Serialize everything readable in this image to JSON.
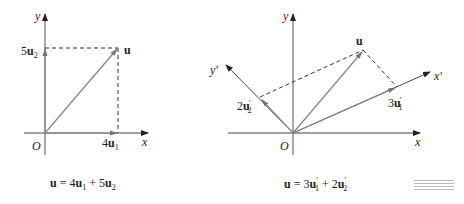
{
  "figures": [
    {
      "id": "left",
      "axes": {
        "x_label": "x",
        "y_label": "y",
        "origin_label": "O"
      },
      "vector_label": "u",
      "component_labels": {
        "x": "4",
        "x_vec": "u",
        "x_sub": "1",
        "y": "5",
        "y_vec": "u",
        "y_sub": "2"
      },
      "equation": {
        "lhs": "u",
        "eq": " = 4",
        "t1_vec": "u",
        "t1_sub": "1",
        "plus": " + 5",
        "t2_vec": "u",
        "t2_sub": "2"
      }
    },
    {
      "id": "right",
      "axes": {
        "x_label": "x",
        "y_label": "y",
        "xp_label": "x′",
        "yp_label": "y′",
        "origin_label": "O"
      },
      "vector_label": "u",
      "component_labels": {
        "x": "3",
        "x_vec": "u",
        "x_sub": "1",
        "x_prime": "′",
        "y": "2",
        "y_vec": "u",
        "y_sub": "2",
        "y_prime": "′"
      },
      "equation": {
        "lhs": "u",
        "eq": " = 3",
        "t1_vec": "u",
        "t1_sub": "1",
        "t1_prime": "′",
        "plus": " + 2",
        "t2_vec": "u",
        "t2_sub": "2",
        "t2_prime": "′"
      }
    }
  ],
  "colors": {
    "axis": "#3a3a3a",
    "vector": "#7a7a7a",
    "dash": "#333333"
  }
}
